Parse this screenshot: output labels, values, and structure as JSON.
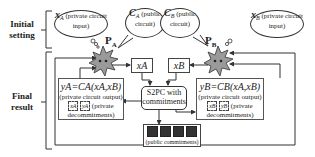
{
  "labels": {
    "initial_setting": "Initial setting",
    "final_result": "Final result"
  },
  "party_a": {
    "name": "P",
    "sub": "A",
    "input_var": "x",
    "input_sub": "A",
    "input_desc": "(private circuit input)",
    "circuit_var": "C",
    "circuit_sub": "A",
    "circuit_desc": "(public circuit)",
    "sent_input": "xA",
    "output_eq": "yA=CA(xA,xB)",
    "output_desc": "(private circuit output)",
    "decommit_1": "xA",
    "decommit_2": "yA",
    "decommit_desc": "(private decommitments)"
  },
  "party_b": {
    "name": "P",
    "sub": "B",
    "input_var": "x",
    "input_sub": "B",
    "input_desc": "(private circuit input)",
    "circuit_var": "C",
    "circuit_sub": "B",
    "circuit_desc": "(public circuit)",
    "sent_input": "xB",
    "output_eq": "yB=CB(xA,xB)",
    "output_desc": "(private circuit output)",
    "decommit_1": "xB",
    "decommit_2": "yB",
    "decommit_desc": "(private decommitments)"
  },
  "center": {
    "title": "S2PC with commitments"
  },
  "public": {
    "label": "(public commitments)",
    "count": 4
  },
  "colors": {
    "star_fill": "#9a9a9a",
    "line": "#333333"
  }
}
